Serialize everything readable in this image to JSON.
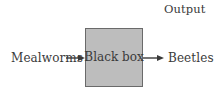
{
  "diagram": {
    "type": "black-box-flow",
    "header_label": "Output",
    "input": {
      "label": "Mealworms"
    },
    "process": {
      "label": "Black box"
    },
    "output": {
      "label": "Beetles"
    },
    "edges": [
      {
        "from": "Mealworms",
        "to": "Black box"
      },
      {
        "from": "Black box",
        "to": "Beetles"
      }
    ]
  },
  "colors": {
    "box_fill": "#bdbdbd",
    "box_border": "#6a6a6a",
    "text": "#3a3a3a",
    "arrow": "#3a3a3a",
    "background": "#ffffff"
  }
}
